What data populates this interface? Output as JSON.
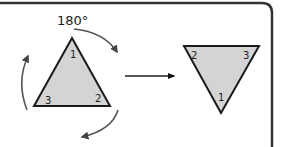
{
  "diagram": {
    "rotation_label": "180°",
    "left_triangle": {
      "vertices": [
        {
          "label": "1",
          "position": "top"
        },
        {
          "label": "2",
          "position": "bottom-right"
        },
        {
          "label": "3",
          "position": "bottom-left"
        }
      ]
    },
    "right_triangle": {
      "vertices": [
        {
          "label": "2",
          "position": "top-left"
        },
        {
          "label": "3",
          "position": "top-right"
        },
        {
          "label": "1",
          "position": "bottom"
        }
      ]
    },
    "colors": {
      "triangle_fill": "#d4d4d4",
      "stroke": "#1a1a1a",
      "arrow": "#555555",
      "frame": "#333333"
    }
  }
}
